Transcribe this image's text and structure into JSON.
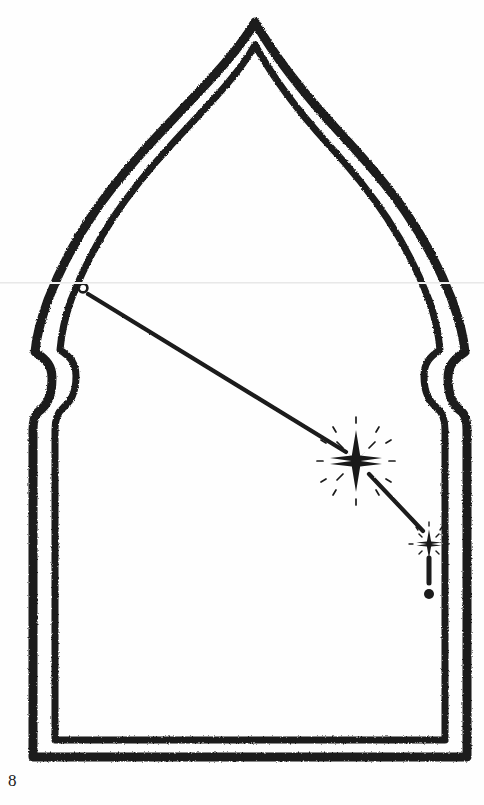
{
  "page": {
    "width": 484,
    "height": 805,
    "background_color": "#fefefe",
    "ink_color": "#1a1a1a",
    "page_number": "8",
    "caption": "",
    "artifact_line_color": "#e8e8e8"
  },
  "figure": {
    "name": "pointed-arch-ray-diagram",
    "stroke_color": "#1a1a1a",
    "outer_stroke_width": 9,
    "inner_stroke_width": 7,
    "arch": {
      "apex_outer": [
        255,
        22
      ],
      "apex_inner": [
        255,
        45
      ],
      "outer_left_x": 33,
      "outer_right_x": 467,
      "inner_left_x": 55,
      "inner_right_x": 452,
      "shoulder_top_y": 352,
      "shoulder_bottom_y": 430,
      "base_outer_y": 757,
      "base_inner_y": 740,
      "widest_y": 300,
      "outer_widest_left_x": 26,
      "outer_widest_right_x": 460
    },
    "ray": {
      "origin_dot": {
        "cx": 83,
        "cy": 288,
        "r": 4.2
      },
      "segment_1": {
        "x1": 88,
        "y1": 294,
        "x2": 346,
        "y2": 452,
        "width": 4.2
      },
      "segment_2": {
        "x1": 369,
        "y1": 474,
        "x2": 423,
        "y2": 531,
        "width": 4.2
      },
      "dash": {
        "x": 429,
        "y1": 558,
        "y2": 583,
        "width": 5
      },
      "terminal_dot": {
        "cx": 429,
        "cy": 594,
        "r": 5
      }
    },
    "stars": [
      {
        "name": "large-sparkle-star",
        "cx": 356,
        "cy": 461,
        "vertical_radius": 30,
        "horizontal_radius": 26,
        "diagonal_radius": 11,
        "spark_count": 8,
        "spark_inner": 17,
        "spark_outer": 24
      },
      {
        "name": "small-sparkle-star",
        "cx": 429,
        "cy": 544,
        "vertical_radius": 14,
        "horizontal_radius": 12,
        "diagonal_radius": 5,
        "spark_count": 8,
        "spark_inner": 8,
        "spark_outer": 12
      }
    ]
  }
}
